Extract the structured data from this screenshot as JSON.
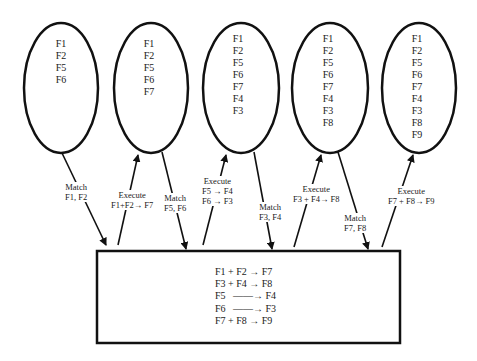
{
  "diagram": {
    "type": "production-system-cycle",
    "memory_states": [
      {
        "id": "state-1",
        "facts": [
          "F1",
          "F2",
          "F5",
          "F6"
        ]
      },
      {
        "id": "state-2",
        "facts": [
          "F1",
          "F2",
          "F5",
          "F6",
          "F7"
        ]
      },
      {
        "id": "state-3",
        "facts": [
          "F1",
          "F2",
          "F5",
          "F6",
          "F7",
          "F4",
          "F3"
        ]
      },
      {
        "id": "state-4",
        "facts": [
          "F1",
          "F2",
          "F5",
          "F6",
          "F7",
          "F4",
          "F3",
          "F8"
        ]
      },
      {
        "id": "state-5",
        "facts": [
          "F1",
          "F2",
          "F5",
          "F6",
          "F7",
          "F4",
          "F3",
          "F8",
          "F9"
        ]
      }
    ],
    "arrows": [
      {
        "kind": "match",
        "line1": "Match",
        "line2": "F1, F2"
      },
      {
        "kind": "execute",
        "line1": "Execute",
        "line2": "F1+F2→ F7"
      },
      {
        "kind": "match",
        "line1": "Match",
        "line2": "F5, F6"
      },
      {
        "kind": "execute",
        "line1": "Execute",
        "line2": "F5 → F4",
        "line3": "F6 → F3"
      },
      {
        "kind": "match",
        "line1": "Match",
        "line2": "F3, F4"
      },
      {
        "kind": "execute",
        "line1": "Execute",
        "line2": "F3 + F4→ F8"
      },
      {
        "kind": "match",
        "line1": "Match",
        "line2": "F7, F8"
      },
      {
        "kind": "execute",
        "line1": "Execute",
        "line2": "F7 + F8→ F9"
      }
    ],
    "rule_base": [
      "F1 + F2 → F7",
      "F3 + F4 → F8",
      "F5   ——→ F4",
      "F6   ——→ F3",
      "F7 + F8 → F9"
    ]
  }
}
